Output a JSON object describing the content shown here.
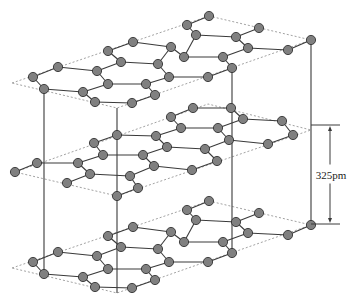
{
  "diagram": {
    "layers": [
      {
        "name": "top-layer",
        "stacking": "A",
        "offset_y": 0
      },
      {
        "name": "middle-layer",
        "stacking": "B"
      },
      {
        "name": "bottom-layer",
        "stacking": "A",
        "offset_y": 185
      }
    ],
    "interlayer_spacing": {
      "label": "325pm",
      "x": 330,
      "y_top": 125,
      "y_bottom": 224
    },
    "colors": {
      "atom_fill": "#808080",
      "atom_stroke": "#333333",
      "bond": "#3a3a3a",
      "dotted_outline": "#8a8a8a"
    },
    "atom_radius": 4.6,
    "layer_A_atoms": [
      [
        209,
        16
      ],
      [
        187,
        25
      ],
      [
        196,
        35
      ],
      [
        259,
        28
      ],
      [
        236,
        37
      ],
      [
        248,
        48
      ],
      [
        311,
        40
      ],
      [
        288,
        50
      ],
      [
        133,
        42
      ],
      [
        171,
        47
      ],
      [
        108,
        51
      ],
      [
        121,
        62
      ],
      [
        158,
        64
      ],
      [
        184,
        57
      ],
      [
        223,
        57
      ],
      [
        232,
        68
      ],
      [
        58,
        67
      ],
      [
        33,
        77
      ],
      [
        97,
        71
      ],
      [
        169,
        77
      ],
      [
        208,
        77
      ],
      [
        44,
        89
      ],
      [
        108,
        84
      ],
      [
        146,
        84
      ],
      [
        83,
        92
      ],
      [
        155,
        95
      ],
      [
        95,
        102
      ],
      [
        132,
        103
      ]
    ],
    "layer_A_bonds": [
      [
        [
          209,
          16
        ],
        [
          187,
          25
        ]
      ],
      [
        [
          187,
          25
        ],
        [
          196,
          35
        ]
      ],
      [
        [
          196,
          35
        ],
        [
          236,
          37
        ]
      ],
      [
        [
          236,
          37
        ],
        [
          259,
          28
        ]
      ],
      [
        [
          236,
          37
        ],
        [
          248,
          48
        ]
      ],
      [
        [
          248,
          48
        ],
        [
          288,
          50
        ]
      ],
      [
        [
          288,
          50
        ],
        [
          311,
          40
        ]
      ],
      [
        [
          133,
          42
        ],
        [
          108,
          51
        ]
      ],
      [
        [
          133,
          42
        ],
        [
          171,
          47
        ]
      ],
      [
        [
          171,
          47
        ],
        [
          184,
          57
        ]
      ],
      [
        [
          196,
          35
        ],
        [
          184,
          57
        ]
      ],
      [
        [
          108,
          51
        ],
        [
          121,
          62
        ]
      ],
      [
        [
          121,
          62
        ],
        [
          158,
          64
        ]
      ],
      [
        [
          158,
          64
        ],
        [
          171,
          47
        ]
      ],
      [
        [
          184,
          57
        ],
        [
          223,
          57
        ]
      ],
      [
        [
          223,
          57
        ],
        [
          248,
          48
        ]
      ],
      [
        [
          223,
          57
        ],
        [
          232,
          68
        ]
      ],
      [
        [
          232,
          68
        ],
        [
          208,
          77
        ]
      ],
      [
        [
          158,
          64
        ],
        [
          169,
          77
        ]
      ],
      [
        [
          169,
          77
        ],
        [
          208,
          77
        ]
      ],
      [
        [
          58,
          67
        ],
        [
          33,
          77
        ]
      ],
      [
        [
          58,
          67
        ],
        [
          97,
          71
        ]
      ],
      [
        [
          97,
          71
        ],
        [
          121,
          62
        ]
      ],
      [
        [
          97,
          71
        ],
        [
          108,
          84
        ]
      ],
      [
        [
          33,
          77
        ],
        [
          44,
          89
        ]
      ],
      [
        [
          44,
          89
        ],
        [
          83,
          92
        ]
      ],
      [
        [
          83,
          92
        ],
        [
          108,
          84
        ]
      ],
      [
        [
          108,
          84
        ],
        [
          146,
          84
        ]
      ],
      [
        [
          146,
          84
        ],
        [
          169,
          77
        ]
      ],
      [
        [
          146,
          84
        ],
        [
          155,
          95
        ]
      ],
      [
        [
          83,
          92
        ],
        [
          95,
          102
        ]
      ],
      [
        [
          95,
          102
        ],
        [
          132,
          103
        ]
      ],
      [
        [
          132,
          103
        ],
        [
          155,
          95
        ]
      ]
    ],
    "layer_A_outline": [
      [
        12,
        83
      ],
      [
        209,
        16
      ],
      [
        311,
        40
      ],
      [
        117,
        108
      ]
    ],
    "layer_B_atoms": [
      [
        193,
        108
      ],
      [
        231,
        108
      ],
      [
        171,
        117
      ],
      [
        243,
        119
      ],
      [
        282,
        121
      ],
      [
        181,
        128
      ],
      [
        218,
        128
      ],
      [
        293,
        135
      ],
      [
        117,
        135
      ],
      [
        156,
        136
      ],
      [
        229,
        140
      ],
      [
        268,
        144
      ],
      [
        94,
        143
      ],
      [
        167,
        147
      ],
      [
        205,
        149
      ],
      [
        103,
        155
      ],
      [
        143,
        155
      ],
      [
        37,
        163
      ],
      [
        78,
        163
      ],
      [
        154,
        166
      ],
      [
        217,
        161
      ],
      [
        15,
        172
      ],
      [
        90,
        174
      ],
      [
        192,
        170
      ],
      [
        130,
        176
      ],
      [
        67,
        183
      ],
      [
        138,
        188
      ],
      [
        117,
        196
      ]
    ],
    "layer_B_bonds": [
      [
        [
          193,
          108
        ],
        [
          231,
          108
        ]
      ],
      [
        [
          193,
          108
        ],
        [
          171,
          117
        ]
      ],
      [
        [
          171,
          117
        ],
        [
          181,
          128
        ]
      ],
      [
        [
          181,
          128
        ],
        [
          218,
          128
        ]
      ],
      [
        [
          218,
          128
        ],
        [
          243,
          119
        ]
      ],
      [
        [
          231,
          108
        ],
        [
          243,
          119
        ]
      ],
      [
        [
          243,
          119
        ],
        [
          282,
          121
        ]
      ],
      [
        [
          282,
          121
        ],
        [
          293,
          135
        ]
      ],
      [
        [
          293,
          135
        ],
        [
          268,
          144
        ]
      ],
      [
        [
          268,
          144
        ],
        [
          229,
          140
        ]
      ],
      [
        [
          229,
          140
        ],
        [
          218,
          128
        ]
      ],
      [
        [
          229,
          140
        ],
        [
          205,
          149
        ]
      ],
      [
        [
          205,
          149
        ],
        [
          217,
          161
        ]
      ],
      [
        [
          217,
          161
        ],
        [
          192,
          170
        ]
      ],
      [
        [
          117,
          135
        ],
        [
          156,
          136
        ]
      ],
      [
        [
          156,
          136
        ],
        [
          181,
          128
        ]
      ],
      [
        [
          156,
          136
        ],
        [
          167,
          147
        ]
      ],
      [
        [
          167,
          147
        ],
        [
          205,
          149
        ]
      ],
      [
        [
          117,
          135
        ],
        [
          94,
          143
        ]
      ],
      [
        [
          94,
          143
        ],
        [
          103,
          155
        ]
      ],
      [
        [
          103,
          155
        ],
        [
          143,
          155
        ]
      ],
      [
        [
          143,
          155
        ],
        [
          167,
          147
        ]
      ],
      [
        [
          143,
          155
        ],
        [
          154,
          166
        ]
      ],
      [
        [
          154,
          166
        ],
        [
          192,
          170
        ]
      ],
      [
        [
          37,
          163
        ],
        [
          15,
          172
        ]
      ],
      [
        [
          37,
          163
        ],
        [
          78,
          163
        ]
      ],
      [
        [
          78,
          163
        ],
        [
          103,
          155
        ]
      ],
      [
        [
          78,
          163
        ],
        [
          90,
          174
        ]
      ],
      [
        [
          90,
          174
        ],
        [
          130,
          176
        ]
      ],
      [
        [
          130,
          176
        ],
        [
          154,
          166
        ]
      ],
      [
        [
          90,
          174
        ],
        [
          67,
          183
        ]
      ],
      [
        [
          130,
          176
        ],
        [
          138,
          188
        ]
      ],
      [
        [
          138,
          188
        ],
        [
          117,
          196
        ]
      ]
    ],
    "layer_B_outline": [
      [
        15,
        172
      ],
      [
        208,
        104
      ],
      [
        311,
        130
      ],
      [
        117,
        196
      ]
    ],
    "vertical_lines": [
      {
        "x": 44,
        "y1": 89,
        "y2": 274
      },
      {
        "x": 117,
        "y1": 108,
        "y2": 293
      },
      {
        "x": 232,
        "y1": 68,
        "y2": 253
      },
      {
        "x": 311,
        "y1": 40,
        "y2": 225
      }
    ]
  }
}
